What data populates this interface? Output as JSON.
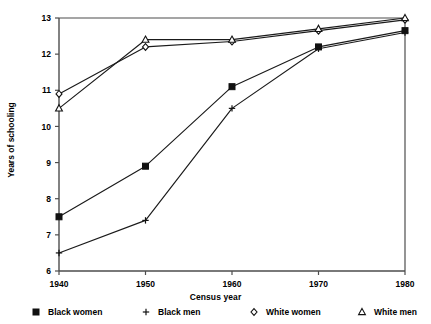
{
  "chart_data": {
    "type": "line",
    "title": "",
    "xlabel": "Census year",
    "ylabel": "Years of schooling",
    "categories": [
      1940,
      1950,
      1960,
      1970,
      1980
    ],
    "x": [
      1940,
      1950,
      1960,
      1970,
      1980
    ],
    "xlim": [
      1940,
      1980
    ],
    "ylim": [
      6,
      13
    ],
    "yticks": [
      6,
      7,
      8,
      9,
      10,
      11,
      12,
      13
    ],
    "xticks": [
      1940,
      1950,
      1960,
      1970,
      1980
    ],
    "grid": false,
    "legend_position": "bottom",
    "series": [
      {
        "name": "Black women",
        "marker": "filled-square",
        "values": [
          7.5,
          8.9,
          11.1,
          12.2,
          12.65
        ]
      },
      {
        "name": "Black men",
        "marker": "plus",
        "values": [
          6.5,
          7.4,
          10.5,
          12.15,
          12.6
        ]
      },
      {
        "name": "White women",
        "marker": "open-diamond",
        "values": [
          10.9,
          12.2,
          12.35,
          12.65,
          12.95
        ]
      },
      {
        "name": "White men",
        "marker": "open-triangle",
        "values": [
          10.5,
          12.4,
          12.4,
          12.7,
          13.0
        ]
      }
    ]
  },
  "legend": {
    "items": [
      {
        "label": "Black women",
        "marker": "filled-square"
      },
      {
        "label": "Black men",
        "marker": "plus"
      },
      {
        "label": "White women",
        "marker": "open-diamond"
      },
      {
        "label": "White men",
        "marker": "open-triangle"
      }
    ]
  },
  "axes": {
    "y_tick_labels": [
      "13",
      "12",
      "11",
      "10",
      "9",
      "8",
      "7",
      "6"
    ],
    "x_tick_labels": [
      "1940",
      "1950",
      "1960",
      "1970",
      "1980"
    ],
    "y_title": "Years of schooling",
    "x_title": "Census year"
  },
  "colors": {
    "line": "#1a1a1a",
    "axis": "#4d4d4d",
    "text": "#000000",
    "background": "#ffffff"
  }
}
